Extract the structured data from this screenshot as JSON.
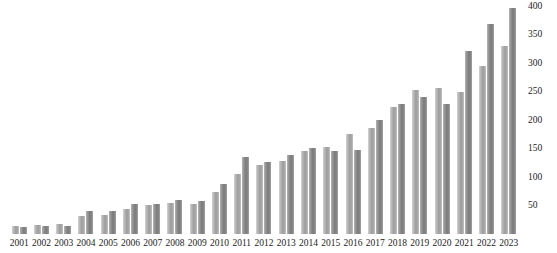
{
  "chart_data": {
    "type": "bar",
    "title": "",
    "subtitle": "",
    "xlabel": "",
    "ylabel": "",
    "grid": false,
    "legend_position": "none",
    "y_axis_side": "right",
    "ylim": [
      0,
      410
    ],
    "yticks": [
      50,
      100,
      150,
      200,
      250,
      300,
      350,
      400
    ],
    "categories": [
      "2001",
      "2002",
      "2003",
      "2004",
      "2005",
      "2006",
      "2007",
      "2008",
      "2009",
      "2010",
      "2011",
      "2012",
      "2013",
      "2014",
      "2015",
      "2016",
      "2017",
      "2018",
      "2019",
      "2020",
      "2021",
      "2022",
      "2023"
    ],
    "series": [
      {
        "name": "Series 1",
        "color": "#9d9d9d",
        "values": [
          14,
          15,
          17,
          31,
          34,
          44,
          50,
          55,
          53,
          73,
          105,
          121,
          128,
          145,
          152,
          175,
          185,
          222,
          252,
          255,
          248,
          295,
          329
        ]
      },
      {
        "name": "Series 2",
        "color": "#7b7b7b",
        "values": [
          13,
          14,
          14,
          41,
          40,
          52,
          53,
          60,
          58,
          88,
          135,
          126,
          138,
          150,
          145,
          147,
          200,
          228,
          240,
          228,
          320,
          368,
          396
        ]
      }
    ]
  }
}
